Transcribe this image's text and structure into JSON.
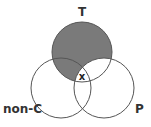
{
  "diagram": {
    "type": "venn",
    "sets": [
      {
        "id": "T",
        "label": "T",
        "cx": 82,
        "cy": 52,
        "r": 30
      },
      {
        "id": "nonC",
        "label": "non-C",
        "cx": 61,
        "cy": 88,
        "r": 30
      },
      {
        "id": "P",
        "label": "P",
        "cx": 104,
        "cy": 88,
        "r": 30
      }
    ],
    "shaded_region": "T minus P",
    "marker": {
      "label": "x",
      "region": "T ∩ non-C ∩ P"
    },
    "colors": {
      "shade": "#7a7a7a",
      "stroke": "#555555",
      "text": "#333333"
    }
  }
}
